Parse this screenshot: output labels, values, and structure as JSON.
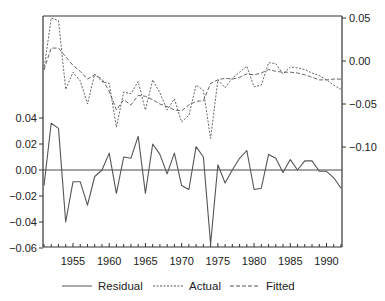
{
  "chart_data": {
    "type": "line",
    "title": "",
    "xlabel": "",
    "x": [
      1951,
      1952,
      1953,
      1954,
      1955,
      1956,
      1957,
      1958,
      1959,
      1960,
      1961,
      1962,
      1963,
      1964,
      1965,
      1966,
      1967,
      1968,
      1969,
      1970,
      1971,
      1972,
      1973,
      1974,
      1975,
      1976,
      1977,
      1978,
      1979,
      1980,
      1981,
      1982,
      1983,
      1984,
      1985,
      1986,
      1987,
      1988,
      1989,
      1990,
      1991,
      1992
    ],
    "xlim": [
      1951,
      1992
    ],
    "x_ticks": [
      1955,
      1960,
      1965,
      1970,
      1975,
      1980,
      1985,
      1990
    ],
    "left_axis": {
      "label": "Residual",
      "ylim": [
        -0.06,
        0.05
      ],
      "ticks": [
        0.04,
        0.02,
        0.0,
        -0.02,
        -0.04,
        -0.06
      ],
      "tick_labels": [
        "0.04",
        "0.02",
        "0.00",
        "−0.02",
        "−0.04",
        "−0.06"
      ]
    },
    "right_axis": {
      "label": "Actual / Fitted",
      "ylim": [
        -0.215,
        0.05
      ],
      "ticks": [
        0.05,
        0.0,
        -0.05,
        -0.1
      ],
      "tick_labels": [
        "0.05",
        "0.00",
        "−0.05",
        "−0.10"
      ]
    },
    "series": [
      {
        "name": "Residual",
        "axis": "left",
        "style": "solid",
        "values": [
          -0.012,
          0.036,
          0.032,
          -0.04,
          -0.009,
          -0.009,
          -0.027,
          -0.005,
          0.0,
          0.013,
          -0.018,
          0.01,
          0.009,
          0.026,
          -0.018,
          0.02,
          0.012,
          -0.003,
          0.013,
          -0.012,
          -0.015,
          0.018,
          0.01,
          -0.057,
          0.004,
          -0.01,
          0.0,
          0.009,
          0.015,
          -0.015,
          -0.014,
          0.012,
          0.009,
          -0.002,
          0.008,
          0.0,
          0.007,
          0.007,
          -0.001,
          -0.001,
          -0.006,
          -0.014
        ]
      },
      {
        "name": "Actual",
        "axis": "right",
        "style": "dotted",
        "values": [
          -0.01,
          0.05,
          0.047,
          -0.033,
          -0.013,
          -0.023,
          -0.05,
          -0.015,
          -0.024,
          -0.026,
          -0.077,
          -0.036,
          -0.038,
          -0.024,
          -0.057,
          -0.022,
          -0.037,
          -0.057,
          -0.044,
          -0.071,
          -0.063,
          -0.028,
          -0.034,
          -0.09,
          -0.022,
          -0.031,
          -0.02,
          -0.013,
          -0.006,
          -0.03,
          -0.028,
          -0.002,
          -0.003,
          -0.015,
          -0.007,
          -0.008,
          -0.01,
          -0.014,
          -0.017,
          -0.022,
          -0.028,
          -0.033
        ]
      },
      {
        "name": "Fitted",
        "axis": "right",
        "style": "dashed",
        "values": [
          -0.01,
          0.015,
          0.015,
          0.005,
          -0.005,
          -0.012,
          -0.021,
          -0.016,
          -0.021,
          -0.035,
          -0.057,
          -0.045,
          -0.051,
          -0.04,
          -0.041,
          -0.045,
          -0.05,
          -0.053,
          -0.057,
          -0.058,
          -0.051,
          -0.047,
          -0.046,
          -0.026,
          -0.022,
          -0.02,
          -0.021,
          -0.019,
          -0.015,
          -0.016,
          -0.014,
          -0.01,
          -0.012,
          -0.013,
          -0.013,
          -0.014,
          -0.016,
          -0.019,
          -0.022,
          -0.022,
          -0.021,
          -0.021
        ]
      }
    ],
    "zero_line_left": true,
    "grid": false,
    "legend_position": "bottom"
  },
  "legend": {
    "items": [
      {
        "label": "Residual",
        "style": "solid"
      },
      {
        "label": "Actual",
        "style": "dotted"
      },
      {
        "label": "Fitted",
        "style": "dashed"
      }
    ]
  },
  "colors": {
    "line": "#555555",
    "axis": "#333333",
    "text": "#222222"
  }
}
